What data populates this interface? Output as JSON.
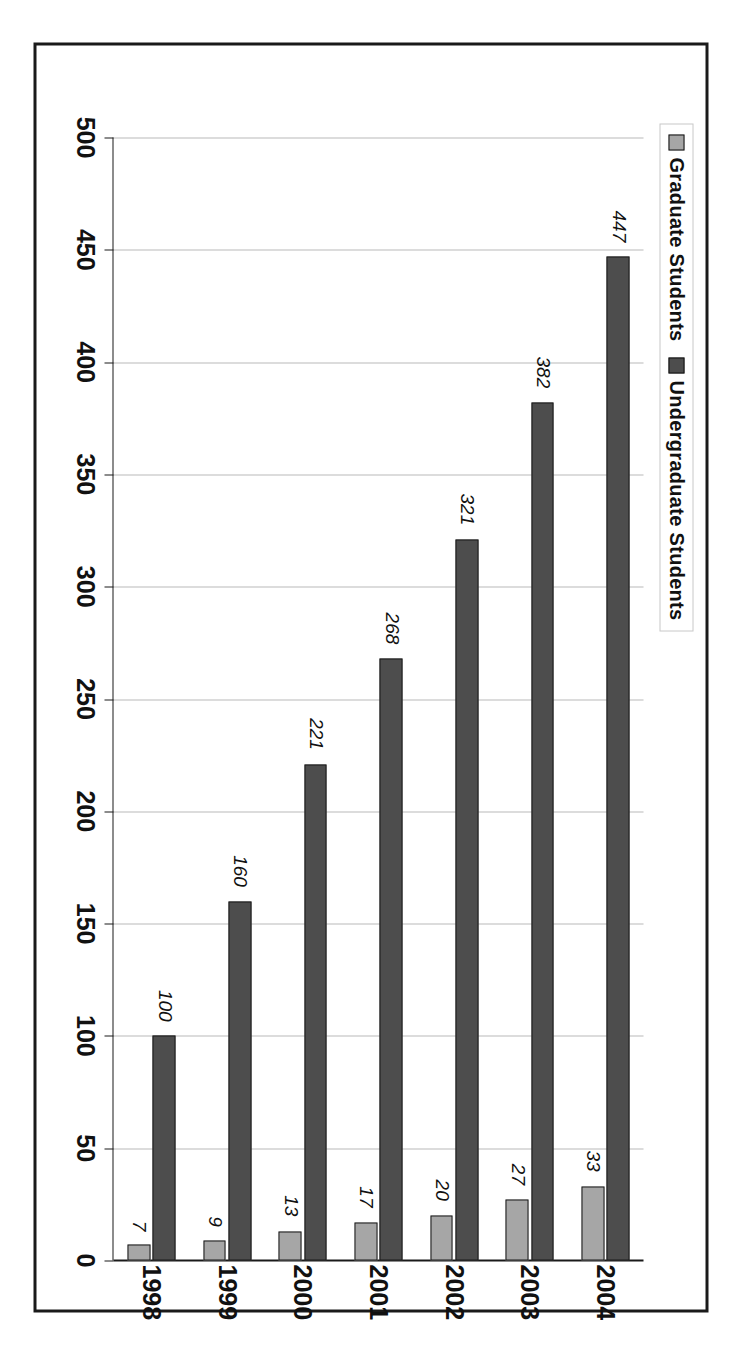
{
  "chart_data": {
    "type": "bar",
    "orientation": "vertical-rotated",
    "title": "",
    "xlabel": "",
    "ylabel": "",
    "categories": [
      "1998",
      "1999",
      "2000",
      "2001",
      "2002",
      "2003",
      "2004"
    ],
    "series": [
      {
        "name": "Graduate Students",
        "color": "#a6a6a6",
        "values": [
          7,
          9,
          13,
          17,
          20,
          27,
          33
        ]
      },
      {
        "name": "Undergraduate Students",
        "color": "#4d4d4d",
        "values": [
          100,
          160,
          221,
          268,
          321,
          382,
          447
        ]
      }
    ],
    "ylim": [
      0,
      500
    ],
    "ytick_labels": [
      "500",
      "450",
      "400",
      "350",
      "300",
      "250",
      "200",
      "150",
      "100",
      "50",
      "0"
    ],
    "ytick_values": [
      500,
      450,
      400,
      350,
      300,
      250,
      200,
      150,
      100,
      50,
      0
    ],
    "grid": true,
    "legend_position": "top",
    "data_labels": true
  },
  "legend": {
    "entries": [
      {
        "label": "Graduate Students",
        "swatch_color": "#a6a6a6",
        "swatch_name": "legend-swatch-graduate"
      },
      {
        "label": "Undergraduate Students",
        "swatch_color": "#4d4d4d",
        "swatch_name": "legend-swatch-undergraduate"
      }
    ]
  },
  "colors": {
    "graduate": "#a6a6a6",
    "undergraduate": "#4d4d4d",
    "border": "#1a1a1a",
    "gridline": "#b9b9b9",
    "background": "#ffffff"
  }
}
